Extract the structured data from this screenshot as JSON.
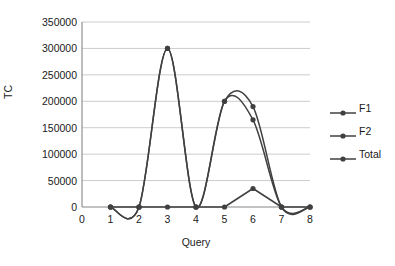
{
  "chart_data": {
    "type": "line",
    "title": "",
    "xlabel": "Query",
    "ylabel": "TC",
    "xlim": [
      0,
      8
    ],
    "ylim": [
      0,
      350000
    ],
    "xticks": [
      0,
      1,
      2,
      3,
      4,
      5,
      6,
      7,
      8
    ],
    "yticks": [
      0,
      50000,
      100000,
      150000,
      200000,
      250000,
      300000,
      350000
    ],
    "ytick_labels": [
      "0",
      "50000",
      "100000",
      "150000",
      "200000",
      "250000",
      "300000",
      "350000"
    ],
    "xtick_labels": [
      "0",
      "1",
      "2",
      "3",
      "4",
      "5",
      "6",
      "7",
      "8"
    ],
    "grid": true,
    "grid_axis": "y",
    "legend_position": "right",
    "x": [
      1,
      2,
      3,
      4,
      5,
      6,
      7,
      8
    ],
    "series": [
      {
        "name": "F1",
        "color": "#404040",
        "marker": "circle",
        "smooth": true,
        "values": [
          0,
          0,
          300000,
          0,
          200000,
          190000,
          0,
          0
        ]
      },
      {
        "name": "F2",
        "color": "#404040",
        "marker": "circle",
        "smooth": false,
        "values": [
          0,
          0,
          0,
          0,
          0,
          35000,
          0,
          0
        ]
      },
      {
        "name": "Total",
        "color": "#404040",
        "marker": "circle",
        "smooth": true,
        "values": [
          0,
          0,
          300000,
          0,
          200000,
          165000,
          0,
          0
        ]
      }
    ]
  },
  "colors": {
    "gridline": "#bfbfbf",
    "axis": "#868686",
    "series": "#404040",
    "text": "#1a1a1a",
    "background": "#ffffff"
  }
}
